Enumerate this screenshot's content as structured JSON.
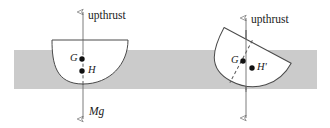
{
  "figure": {
    "canvas": {
      "width": 330,
      "height": 128,
      "background": "#ffffff"
    },
    "water": {
      "name": "water-band",
      "color": "#cbcbcb",
      "x": 14,
      "y": 50,
      "width": 303,
      "height": 39
    },
    "strokes": {
      "outline": "#4a4a4a",
      "axis": "#6e6e6e",
      "dashed": "#5a5a5a",
      "point": "#111111"
    },
    "left_diagram": {
      "name": "upright-floating-body",
      "body": {
        "shape": "bowl",
        "flat_top_y": 40,
        "left_x": 52,
        "right_x": 128,
        "bottom_y": 84
      },
      "upthrust_arrow": {
        "label": "upthrust",
        "tip_x": 83,
        "tip_y": 9,
        "label_x": 88,
        "label_y": 10
      },
      "weight_arrow": {
        "label": "Mg",
        "tip_x": 83,
        "tip_y": 122,
        "label_x": 89,
        "label_y": 106
      },
      "points": [
        {
          "label": "G",
          "name": "centre-of-gravity",
          "x": 82,
          "y": 59,
          "label_side": "left"
        },
        {
          "label": "H",
          "name": "centre-of-buoyancy",
          "x": 82,
          "y": 71,
          "label_side": "right"
        }
      ]
    },
    "right_diagram": {
      "name": "tilted-floating-body",
      "body": {
        "shape": "bowl",
        "rotation_deg": 28,
        "centre_x": 243,
        "centre_y": 58
      },
      "upthrust_arrow": {
        "label": "upthrust",
        "tip_x": 246,
        "tip_y": 15,
        "label_x": 251,
        "label_y": 14
      },
      "weight_arrow": {
        "label": "",
        "tip_x": 246,
        "tip_y": 121
      },
      "points": [
        {
          "label": "G",
          "name": "centre-of-gravity",
          "x": 243,
          "y": 61,
          "label_side": "left"
        },
        {
          "label": "H'",
          "name": "centre-of-buoyancy-tilted",
          "x": 252,
          "y": 68,
          "label_side": "right"
        }
      ]
    }
  }
}
